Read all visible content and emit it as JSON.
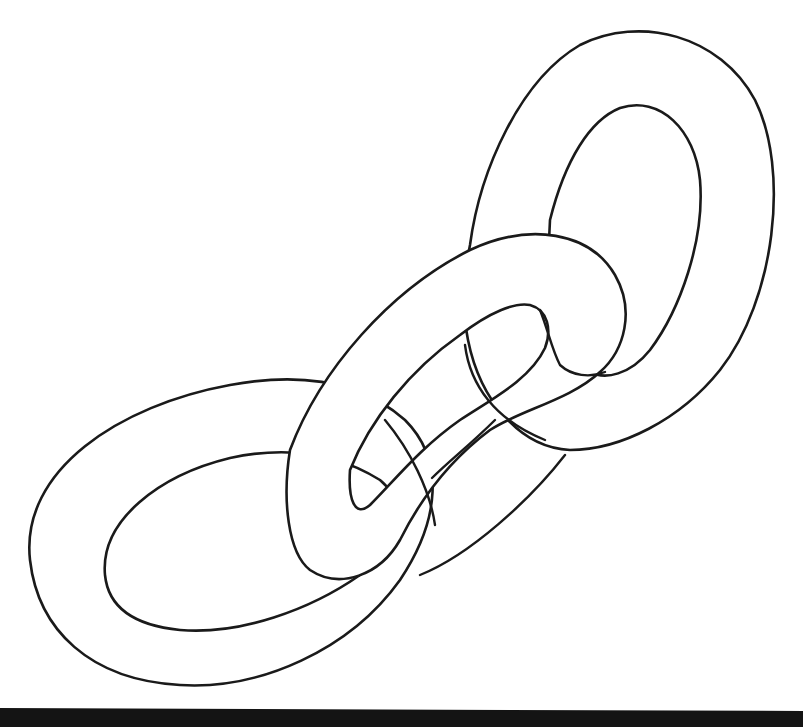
{
  "illustration": {
    "title": "Chain links",
    "subject": "three interlocking chain links line art",
    "link_count": 3,
    "links": [
      {
        "name": "top-right-link"
      },
      {
        "name": "middle-link"
      },
      {
        "name": "bottom-left-link"
      }
    ],
    "colors": {
      "background": "#ffffff",
      "outline": "#1a1a1a",
      "bottom_bar": "#141414"
    }
  }
}
